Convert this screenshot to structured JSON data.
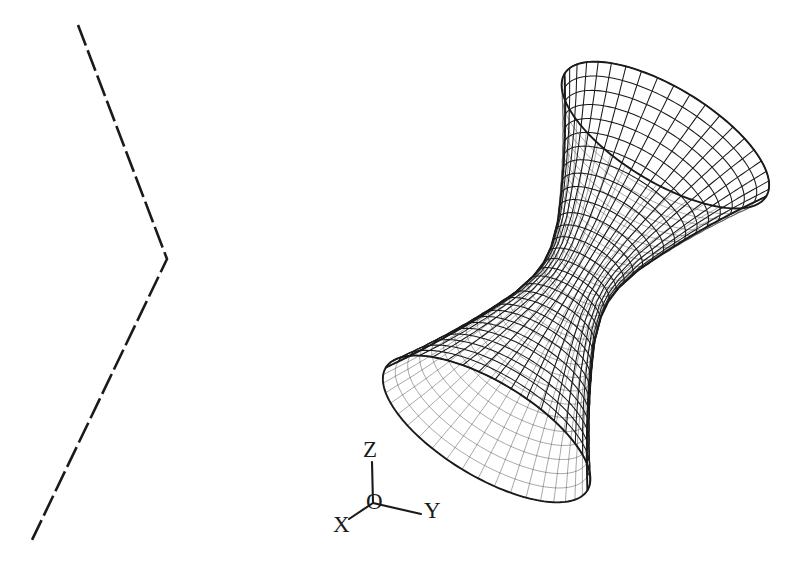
{
  "figure": {
    "type": "technical-line-drawing",
    "background_color": "#ffffff",
    "stroke_color": "#1a1a1a",
    "width": 809,
    "height": 573
  },
  "axes": {
    "name": "coordinate-axis-triad",
    "origin_label": "O",
    "origin_point": [
      373,
      503
    ],
    "labels": {
      "z": "Z",
      "y": "Y",
      "x": "X",
      "o": "O"
    },
    "label_positions": {
      "z": [
        363,
        457
      ],
      "y": [
        424,
        518
      ],
      "x": [
        333,
        532
      ],
      "o": [
        366,
        509
      ]
    },
    "segments": {
      "z_axis": [
        [
          373,
          503
        ],
        [
          372,
          462
        ]
      ],
      "y_axis": [
        [
          373,
          503
        ],
        [
          421,
          514
        ]
      ],
      "x_axis": [
        [
          373,
          503
        ],
        [
          349,
          519
        ]
      ]
    }
  },
  "dashed_polyline": {
    "name": "bent-dashed-reference-line",
    "style": "dashed",
    "dash_length": 22,
    "gap_length": 5,
    "stroke_width": 2.6,
    "vertices": [
      [
        78,
        25
      ],
      [
        167,
        259
      ],
      [
        32,
        540
      ]
    ]
  },
  "surface": {
    "name": "surface-of-revolution-wireframe",
    "description": "hourglass / catenoid-like surface of revolution rendered as a quad mesh",
    "render_style": "wireframe-mesh",
    "stroke_width": 1.0,
    "meridian_count": 40,
    "parallel_count": 30,
    "bounding_box": {
      "left": 404,
      "top": 97,
      "right": 747,
      "bottom": 466
    },
    "axis_direction_screen": [
      0.52,
      -0.855
    ],
    "profile": {
      "description": "radius as a function of height along the axis of revolution",
      "t": [
        -1.0,
        -0.85,
        -0.7,
        -0.55,
        -0.4,
        -0.25,
        -0.1,
        0.0,
        0.1,
        0.25,
        0.4,
        0.55,
        0.7,
        0.85,
        1.0
      ],
      "radius": [
        1.0,
        0.86,
        0.73,
        0.61,
        0.5,
        0.4,
        0.335,
        0.32,
        0.335,
        0.4,
        0.5,
        0.61,
        0.73,
        0.86,
        1.0
      ]
    },
    "center_screen": [
      576,
      282
    ],
    "axis_half_length": 172,
    "radius_scale": 118
  },
  "chart_data": {
    "type": "line",
    "title": "",
    "xlabel": "",
    "ylabel": "",
    "series": [
      {
        "name": "meridian-profile",
        "x": [
          -1.0,
          -0.85,
          -0.7,
          -0.55,
          -0.4,
          -0.25,
          -0.1,
          0.0,
          0.1,
          0.25,
          0.4,
          0.55,
          0.7,
          0.85,
          1.0
        ],
        "values": [
          1.0,
          0.86,
          0.73,
          0.61,
          0.5,
          0.4,
          0.335,
          0.32,
          0.335,
          0.4,
          0.5,
          0.61,
          0.73,
          0.86,
          1.0
        ]
      }
    ]
  }
}
